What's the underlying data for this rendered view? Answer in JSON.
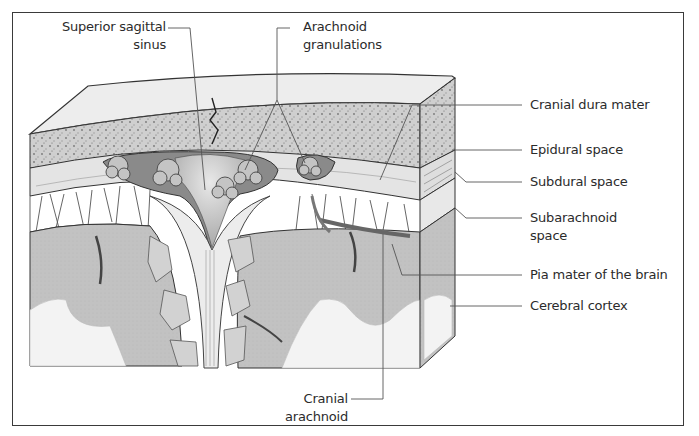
{
  "figure": {
    "colors": {
      "frame": "#3a3a3a",
      "leader_line": "#555555",
      "text": "#2b2b2b",
      "bone": "#c9c9c9",
      "dura": "#e6e6e6",
      "sinus_dark": "#7a7a7a",
      "sinus_light": "#d8d8d8",
      "granulation": "#bdbdbd",
      "cortex_gray": "#bfbfbf",
      "white_matter": "#f4f4f4",
      "vessel": "#6e6e6e"
    }
  },
  "labels": {
    "superior_sagittal_sinus": {
      "line1": "Superior sagittal",
      "line2": "sinus"
    },
    "arachnoid_granulations": {
      "line1": "Arachnoid",
      "line2": "granulations"
    },
    "cranial_dura_mater": {
      "text": "Cranial dura mater"
    },
    "epidural_space": {
      "text": "Epidural space"
    },
    "subdural_space": {
      "text": "Subdural space"
    },
    "subarachnoid_space": {
      "line1": "Subarachnoid",
      "line2": "space"
    },
    "pia_mater": {
      "text": "Pia mater of the brain"
    },
    "cerebral_cortex": {
      "text": "Cerebral cortex"
    },
    "cranial_arachnoid": {
      "line1": "Cranial",
      "line2": "arachnoid"
    }
  }
}
